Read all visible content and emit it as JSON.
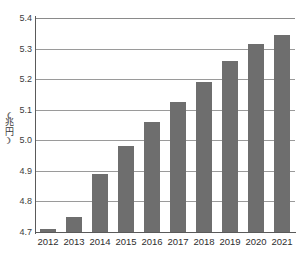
{
  "chart_data": {
    "type": "bar",
    "title": "",
    "subtitle": "",
    "xlabel": "",
    "ylabel": "(兆円)",
    "ylabel_chars": [
      "(",
      "兆",
      "円",
      ")"
    ],
    "categories": [
      "2012",
      "2013",
      "2014",
      "2015",
      "2016",
      "2017",
      "2018",
      "2019",
      "2020",
      "2021"
    ],
    "values": [
      4.71,
      4.75,
      4.89,
      4.98,
      5.06,
      5.125,
      5.19,
      5.26,
      5.315,
      5.345
    ],
    "ylim": [
      4.7,
      5.4
    ],
    "ytick_labels": [
      "5.4",
      "5.3",
      "5.2",
      "5.1",
      "5.0",
      "4.9",
      "4.8",
      "4.7"
    ],
    "ytick_values": [
      5.4,
      5.3,
      5.2,
      5.1,
      5.0,
      4.9,
      4.8,
      4.7
    ],
    "grid": true,
    "legend": false,
    "legend_position": "none",
    "bar_color": "#6e6e6e",
    "gridline_color": "#9a9a9a",
    "axis_color": "#5a5a5a",
    "background_color": "#ffffff"
  }
}
